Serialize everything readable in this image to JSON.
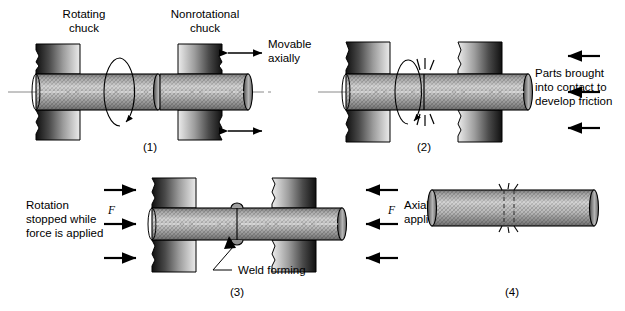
{
  "figure": {
    "colors": {
      "line": "#000000",
      "bar_light": "#c9c9c9",
      "bar_mid": "#9a9a9a",
      "bar_dark": "#6e6e6e",
      "chuck_dark": "#2f2f2f",
      "chuck_light": "#e2e2e2",
      "centerline": "#7a7a7a",
      "background": "#ffffff"
    }
  },
  "panels": [
    {
      "caption": "(1)",
      "labels": {
        "left_chuck": "Rotating\nchuck",
        "left_chuck_line1": "Rotating",
        "left_chuck_line2": "chuck",
        "right_chuck_line1": "Nonrotational",
        "right_chuck_line2": "chuck",
        "movable_line1": "Movable",
        "movable_line2": "axially"
      }
    },
    {
      "caption": "(2)",
      "labels": {
        "contact_line1": "Parts brought",
        "contact_line2": "into contact to",
        "contact_line3": "develop friction"
      }
    },
    {
      "caption": "(3)",
      "labels": {
        "rotation_line1": "Rotation",
        "rotation_line2": "stopped while",
        "rotation_line3": "force is applied",
        "axial_line1": "Axial force",
        "axial_line2": "applied",
        "force_symbol_left": "F",
        "force_symbol_right": "F",
        "weld_forming": "Weld forming"
      }
    },
    {
      "caption": "(4)",
      "labels": {}
    }
  ]
}
